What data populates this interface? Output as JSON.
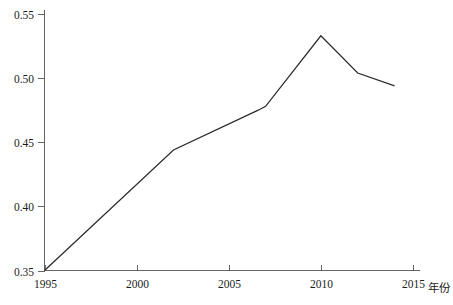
{
  "chart_data": {
    "type": "line",
    "title": "",
    "subtitle": "",
    "xlabel": "年份",
    "ylabel": "",
    "xlim": [
      1995,
      2015
    ],
    "ylim": [
      0.35,
      0.55
    ],
    "grid": false,
    "legend": "none",
    "x_ticks": [
      "1995",
      "2000",
      "2005",
      "2010",
      "2015"
    ],
    "x_tick_values": [
      1995,
      2000,
      2005,
      2010,
      2015
    ],
    "y_ticks": [
      "0.35",
      "0.40",
      "0.45",
      "0.50",
      "0.55"
    ],
    "y_tick_values": [
      0.35,
      0.4,
      0.45,
      0.5,
      0.55
    ],
    "series": [
      {
        "name": "series-1",
        "color": "#2b2b2b",
        "x": [
          1995,
          2002,
          2006.6,
          2007,
          2010,
          2012,
          2014
        ],
        "values": [
          0.35,
          0.444,
          0.475,
          0.478,
          0.533,
          0.504,
          0.494
        ]
      }
    ]
  },
  "axes": {
    "x_axis_name": "年份",
    "y_axis_name": ""
  },
  "colors": {
    "line": "#2b2b2b",
    "axis": "#555555",
    "text": "#1c1c1c",
    "background": "#ffffff"
  }
}
